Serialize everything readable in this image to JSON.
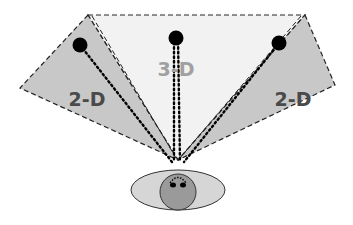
{
  "diagram": {
    "labels": {
      "left": "2-D",
      "center": "3-D",
      "right": "2-D"
    },
    "colors": {
      "side_fill": "#c8c8c8",
      "center_fill": "#f2f2f2",
      "dashed_stroke": "#222222",
      "dot": "#000000",
      "side_label": "#4a4a4a",
      "center_label": "#a0a0a0",
      "eye_outer": "#d6d6d6",
      "eye_inner": "#9a9a9a"
    },
    "regions": [
      {
        "name": "left-view-2d",
        "points": [
          [
            88,
            15
          ],
          [
            20,
            88
          ],
          [
            178,
            160
          ]
        ],
        "dot": [
          80,
          45
        ]
      },
      {
        "name": "center-view-3d",
        "points": [
          [
            88,
            15
          ],
          [
            305,
            15
          ],
          [
            178,
            160
          ]
        ],
        "dot": [
          176,
          38
        ]
      },
      {
        "name": "right-view-2d",
        "points": [
          [
            305,
            15
          ],
          [
            335,
            85
          ],
          [
            178,
            160
          ]
        ],
        "dot": [
          279,
          43
        ]
      }
    ],
    "eye": {
      "outer": {
        "cx": 178,
        "cy": 190,
        "rx": 47,
        "ry": 20
      },
      "inner": {
        "cx": 178,
        "cy": 192,
        "r": 18
      }
    }
  }
}
